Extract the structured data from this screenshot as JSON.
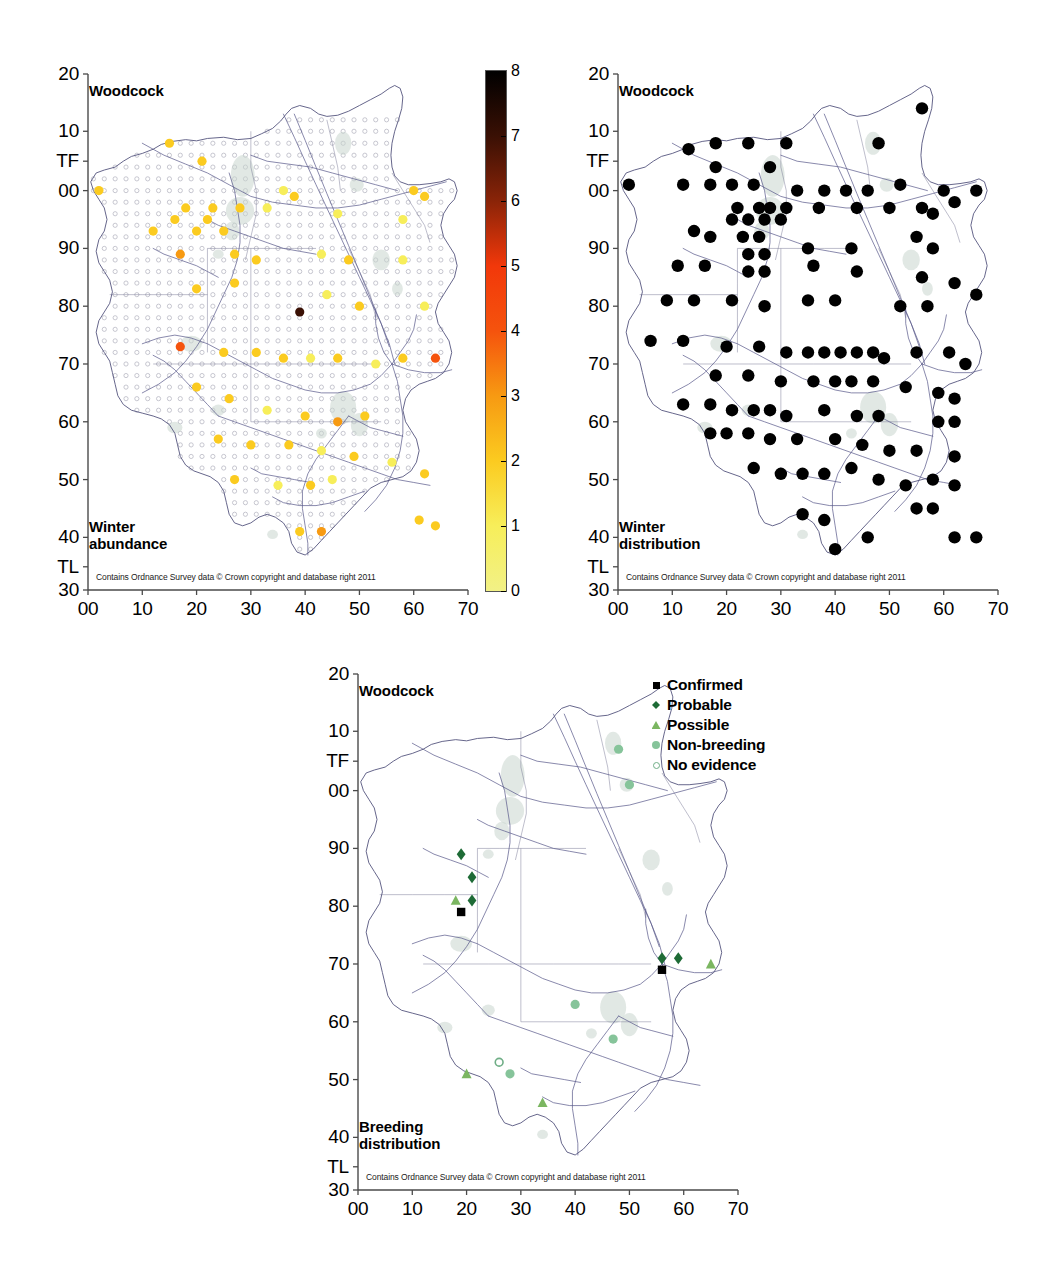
{
  "figure": {
    "species": "Woodcock",
    "attribution": "Contains Ordnance Survey data © Crown copyright and database right 2011"
  },
  "axes": {
    "x_ticks": [
      "00",
      "10",
      "20",
      "30",
      "40",
      "50",
      "60",
      "70"
    ],
    "y_ticks": [
      "20",
      "10",
      "TF",
      "00",
      "90",
      "80",
      "70",
      "60",
      "50",
      "40",
      "TL",
      "30"
    ],
    "x_values": [
      0,
      10,
      20,
      30,
      40,
      50,
      60,
      70
    ],
    "y_values": [
      120,
      110,
      105,
      100,
      90,
      80,
      70,
      60,
      50,
      40,
      35,
      30
    ]
  },
  "panels": [
    {
      "id": "winter-abundance",
      "title": "Woodcock",
      "caption_line1": "Winter",
      "caption_line2": "abundance",
      "attribution": "Contains Ordnance Survey data © Crown copyright and database right 2011"
    },
    {
      "id": "winter-distribution",
      "title": "Woodcock",
      "caption_line1": "Winter",
      "caption_line2": "distribution",
      "attribution": "Contains Ordnance Survey data © Crown copyright and database right 2011"
    },
    {
      "id": "breeding-distribution",
      "title": "Woodcock",
      "caption_line1": "Breeding",
      "caption_line2": "distribution",
      "attribution": "Contains Ordnance Survey data © Crown copyright and database right 2011"
    }
  ],
  "colorbar": {
    "min": 0,
    "max": 8,
    "tick_labels": [
      "0",
      "1",
      "2",
      "3",
      "4",
      "5",
      "6",
      "7",
      "8"
    ],
    "tick_values": [
      0,
      1,
      2,
      3,
      4,
      5,
      6,
      7,
      8
    ],
    "stops": [
      {
        "value": 0,
        "color": "#f2f186"
      },
      {
        "value": 1,
        "color": "#f7ee5a"
      },
      {
        "value": 2,
        "color": "#fbcb20"
      },
      {
        "value": 3,
        "color": "#f79a12"
      },
      {
        "value": 4,
        "color": "#f5530d"
      },
      {
        "value": 5,
        "color": "#f2380a"
      },
      {
        "value": 6,
        "color": "#8a2408"
      },
      {
        "value": 7,
        "color": "#3a1004"
      },
      {
        "value": 8,
        "color": "#000000"
      }
    ]
  },
  "breeding_legend": {
    "items": [
      {
        "label": "Confirmed",
        "marker": "square",
        "color": "#000000"
      },
      {
        "label": "Probable",
        "marker": "diamond",
        "color": "#1e6b36"
      },
      {
        "label": "Possible",
        "marker": "triangle",
        "color": "#7bb661"
      },
      {
        "label": "Non-breeding",
        "marker": "circle",
        "color": "#86c49a"
      },
      {
        "label": "No evidence",
        "marker": "open-circle",
        "color": "#6fae86"
      }
    ]
  },
  "chart_data": {
    "type": "scatter",
    "xlabel": "",
    "ylabel": "",
    "xlim": [
      0,
      70
    ],
    "ylim": [
      30,
      120
    ],
    "grid": false,
    "legend_position": "top-right (breeding panel)",
    "note": "Three OS-grid maps of Lincolnshire. x = easting 00-70, y = northing 30(TL)-20(TF). Abundance values use the 0-8 colour scale.",
    "series": [
      {
        "name": "Winter abundance",
        "panel": "winter-abundance",
        "value_range": [
          0,
          8
        ],
        "points": [
          {
            "x": 15,
            "y": 108,
            "v": 2
          },
          {
            "x": 2,
            "y": 100,
            "v": 2
          },
          {
            "x": 21,
            "y": 105,
            "v": 2
          },
          {
            "x": 36,
            "y": 100,
            "v": 1
          },
          {
            "x": 38,
            "y": 99,
            "v": 2
          },
          {
            "x": 18,
            "y": 97,
            "v": 2
          },
          {
            "x": 23,
            "y": 97,
            "v": 2
          },
          {
            "x": 28,
            "y": 97,
            "v": 2
          },
          {
            "x": 16,
            "y": 95,
            "v": 2
          },
          {
            "x": 22,
            "y": 95,
            "v": 2
          },
          {
            "x": 12,
            "y": 93,
            "v": 2
          },
          {
            "x": 20,
            "y": 93,
            "v": 2
          },
          {
            "x": 25,
            "y": 93,
            "v": 2
          },
          {
            "x": 33,
            "y": 97,
            "v": 1
          },
          {
            "x": 60,
            "y": 100,
            "v": 2
          },
          {
            "x": 62,
            "y": 99,
            "v": 2
          },
          {
            "x": 58,
            "y": 95,
            "v": 1
          },
          {
            "x": 46,
            "y": 96,
            "v": 1
          },
          {
            "x": 17,
            "y": 89,
            "v": 3
          },
          {
            "x": 27,
            "y": 89,
            "v": 2
          },
          {
            "x": 31,
            "y": 88,
            "v": 2
          },
          {
            "x": 43,
            "y": 89,
            "v": 1
          },
          {
            "x": 48,
            "y": 88,
            "v": 2
          },
          {
            "x": 58,
            "y": 88,
            "v": 1
          },
          {
            "x": 20,
            "y": 83,
            "v": 2
          },
          {
            "x": 27,
            "y": 84,
            "v": 2
          },
          {
            "x": 39,
            "y": 79,
            "v": 7
          },
          {
            "x": 44,
            "y": 82,
            "v": 1
          },
          {
            "x": 50,
            "y": 80,
            "v": 2
          },
          {
            "x": 62,
            "y": 80,
            "v": 1
          },
          {
            "x": 17,
            "y": 73,
            "v": 4
          },
          {
            "x": 25,
            "y": 72,
            "v": 2
          },
          {
            "x": 31,
            "y": 72,
            "v": 2
          },
          {
            "x": 36,
            "y": 71,
            "v": 2
          },
          {
            "x": 41,
            "y": 71,
            "v": 1
          },
          {
            "x": 46,
            "y": 71,
            "v": 2
          },
          {
            "x": 53,
            "y": 70,
            "v": 1
          },
          {
            "x": 58,
            "y": 71,
            "v": 2
          },
          {
            "x": 64,
            "y": 71,
            "v": 4
          },
          {
            "x": 20,
            "y": 66,
            "v": 2
          },
          {
            "x": 26,
            "y": 64,
            "v": 2
          },
          {
            "x": 33,
            "y": 62,
            "v": 1
          },
          {
            "x": 40,
            "y": 61,
            "v": 2
          },
          {
            "x": 46,
            "y": 60,
            "v": 3
          },
          {
            "x": 51,
            "y": 61,
            "v": 2
          },
          {
            "x": 24,
            "y": 57,
            "v": 2
          },
          {
            "x": 30,
            "y": 56,
            "v": 2
          },
          {
            "x": 37,
            "y": 56,
            "v": 2
          },
          {
            "x": 43,
            "y": 55,
            "v": 1
          },
          {
            "x": 49,
            "y": 54,
            "v": 2
          },
          {
            "x": 56,
            "y": 53,
            "v": 1
          },
          {
            "x": 62,
            "y": 51,
            "v": 2
          },
          {
            "x": 27,
            "y": 50,
            "v": 2
          },
          {
            "x": 35,
            "y": 49,
            "v": 1
          },
          {
            "x": 41,
            "y": 49,
            "v": 2
          },
          {
            "x": 45,
            "y": 50,
            "v": 1
          },
          {
            "x": 39,
            "y": 41,
            "v": 2
          },
          {
            "x": 43,
            "y": 41,
            "v": 3
          },
          {
            "x": 61,
            "y": 43,
            "v": 2
          },
          {
            "x": 64,
            "y": 42,
            "v": 2
          }
        ]
      },
      {
        "name": "Winter distribution",
        "panel": "winter-distribution",
        "marker": "filled-circle-black",
        "points": [
          {
            "x": 13,
            "y": 107
          },
          {
            "x": 18,
            "y": 108
          },
          {
            "x": 24,
            "y": 108
          },
          {
            "x": 31,
            "y": 108
          },
          {
            "x": 48,
            "y": 108
          },
          {
            "x": 56,
            "y": 114
          },
          {
            "x": 2,
            "y": 101
          },
          {
            "x": 12,
            "y": 101
          },
          {
            "x": 17,
            "y": 101
          },
          {
            "x": 21,
            "y": 101
          },
          {
            "x": 25,
            "y": 101
          },
          {
            "x": 18,
            "y": 104
          },
          {
            "x": 28,
            "y": 104
          },
          {
            "x": 33,
            "y": 100
          },
          {
            "x": 38,
            "y": 100
          },
          {
            "x": 42,
            "y": 100
          },
          {
            "x": 46,
            "y": 100
          },
          {
            "x": 52,
            "y": 101
          },
          {
            "x": 60,
            "y": 100
          },
          {
            "x": 62,
            "y": 98
          },
          {
            "x": 66,
            "y": 100
          },
          {
            "x": 22,
            "y": 97
          },
          {
            "x": 26,
            "y": 97
          },
          {
            "x": 28,
            "y": 97
          },
          {
            "x": 31,
            "y": 97
          },
          {
            "x": 21,
            "y": 95
          },
          {
            "x": 24,
            "y": 95
          },
          {
            "x": 27,
            "y": 95
          },
          {
            "x": 30,
            "y": 95
          },
          {
            "x": 37,
            "y": 97
          },
          {
            "x": 44,
            "y": 97
          },
          {
            "x": 50,
            "y": 97
          },
          {
            "x": 56,
            "y": 97
          },
          {
            "x": 58,
            "y": 96
          },
          {
            "x": 23,
            "y": 92
          },
          {
            "x": 26,
            "y": 92
          },
          {
            "x": 14,
            "y": 93
          },
          {
            "x": 17,
            "y": 92
          },
          {
            "x": 24,
            "y": 89
          },
          {
            "x": 27,
            "y": 89
          },
          {
            "x": 35,
            "y": 90
          },
          {
            "x": 43,
            "y": 90
          },
          {
            "x": 55,
            "y": 92
          },
          {
            "x": 58,
            "y": 90
          },
          {
            "x": 11,
            "y": 87
          },
          {
            "x": 16,
            "y": 87
          },
          {
            "x": 24,
            "y": 86
          },
          {
            "x": 27,
            "y": 86
          },
          {
            "x": 36,
            "y": 87
          },
          {
            "x": 44,
            "y": 86
          },
          {
            "x": 56,
            "y": 85
          },
          {
            "x": 62,
            "y": 84
          },
          {
            "x": 9,
            "y": 81
          },
          {
            "x": 14,
            "y": 81
          },
          {
            "x": 21,
            "y": 81
          },
          {
            "x": 27,
            "y": 80
          },
          {
            "x": 35,
            "y": 81
          },
          {
            "x": 40,
            "y": 81
          },
          {
            "x": 52,
            "y": 80
          },
          {
            "x": 57,
            "y": 80
          },
          {
            "x": 66,
            "y": 82
          },
          {
            "x": 6,
            "y": 74
          },
          {
            "x": 12,
            "y": 74
          },
          {
            "x": 20,
            "y": 73
          },
          {
            "x": 26,
            "y": 73
          },
          {
            "x": 31,
            "y": 72
          },
          {
            "x": 35,
            "y": 72
          },
          {
            "x": 38,
            "y": 72
          },
          {
            "x": 41,
            "y": 72
          },
          {
            "x": 44,
            "y": 72
          },
          {
            "x": 47,
            "y": 72
          },
          {
            "x": 49,
            "y": 71
          },
          {
            "x": 55,
            "y": 72
          },
          {
            "x": 61,
            "y": 72
          },
          {
            "x": 64,
            "y": 70
          },
          {
            "x": 18,
            "y": 68
          },
          {
            "x": 24,
            "y": 68
          },
          {
            "x": 30,
            "y": 67
          },
          {
            "x": 36,
            "y": 67
          },
          {
            "x": 40,
            "y": 67
          },
          {
            "x": 43,
            "y": 67
          },
          {
            "x": 47,
            "y": 67
          },
          {
            "x": 53,
            "y": 66
          },
          {
            "x": 59,
            "y": 65
          },
          {
            "x": 62,
            "y": 64
          },
          {
            "x": 12,
            "y": 63
          },
          {
            "x": 17,
            "y": 63
          },
          {
            "x": 21,
            "y": 62
          },
          {
            "x": 25,
            "y": 62
          },
          {
            "x": 28,
            "y": 62
          },
          {
            "x": 31,
            "y": 61
          },
          {
            "x": 38,
            "y": 62
          },
          {
            "x": 44,
            "y": 61
          },
          {
            "x": 48,
            "y": 61
          },
          {
            "x": 59,
            "y": 60
          },
          {
            "x": 62,
            "y": 60
          },
          {
            "x": 17,
            "y": 58
          },
          {
            "x": 20,
            "y": 58
          },
          {
            "x": 24,
            "y": 58
          },
          {
            "x": 28,
            "y": 57
          },
          {
            "x": 33,
            "y": 57
          },
          {
            "x": 40,
            "y": 57
          },
          {
            "x": 45,
            "y": 56
          },
          {
            "x": 50,
            "y": 55
          },
          {
            "x": 55,
            "y": 55
          },
          {
            "x": 62,
            "y": 54
          },
          {
            "x": 25,
            "y": 52
          },
          {
            "x": 30,
            "y": 51
          },
          {
            "x": 34,
            "y": 51
          },
          {
            "x": 38,
            "y": 51
          },
          {
            "x": 43,
            "y": 52
          },
          {
            "x": 48,
            "y": 50
          },
          {
            "x": 53,
            "y": 49
          },
          {
            "x": 58,
            "y": 50
          },
          {
            "x": 62,
            "y": 49
          },
          {
            "x": 55,
            "y": 45
          },
          {
            "x": 58,
            "y": 45
          },
          {
            "x": 34,
            "y": 44
          },
          {
            "x": 38,
            "y": 43
          },
          {
            "x": 40,
            "y": 38
          },
          {
            "x": 46,
            "y": 40
          },
          {
            "x": 62,
            "y": 40
          },
          {
            "x": 66,
            "y": 40
          }
        ]
      },
      {
        "name": "Breeding distribution",
        "panel": "breeding-distribution",
        "points": [
          {
            "x": 19,
            "y": 89,
            "status": "Probable"
          },
          {
            "x": 21,
            "y": 85,
            "status": "Probable"
          },
          {
            "x": 18,
            "y": 81,
            "status": "Possible"
          },
          {
            "x": 21,
            "y": 81,
            "status": "Probable"
          },
          {
            "x": 19,
            "y": 79,
            "status": "Confirmed"
          },
          {
            "x": 56,
            "y": 71,
            "status": "Probable"
          },
          {
            "x": 59,
            "y": 71,
            "status": "Probable"
          },
          {
            "x": 65,
            "y": 70,
            "status": "Possible"
          },
          {
            "x": 56,
            "y": 69,
            "status": "Confirmed"
          },
          {
            "x": 40,
            "y": 63,
            "status": "Non-breeding"
          },
          {
            "x": 47,
            "y": 57,
            "status": "Non-breeding"
          },
          {
            "x": 48,
            "y": 107,
            "status": "Non-breeding"
          },
          {
            "x": 50,
            "y": 101,
            "status": "Non-breeding"
          },
          {
            "x": 26,
            "y": 53,
            "status": "No evidence"
          },
          {
            "x": 20,
            "y": 51,
            "status": "Possible"
          },
          {
            "x": 28,
            "y": 51,
            "status": "Non-breeding"
          },
          {
            "x": 34,
            "y": 46,
            "status": "Possible"
          }
        ]
      }
    ]
  }
}
